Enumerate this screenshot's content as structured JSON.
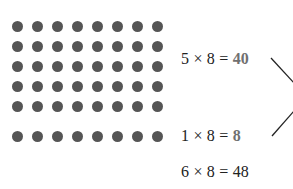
{
  "diagram": {
    "dot_color": "#555555",
    "grid": {
      "rows": 5,
      "cols": 8
    },
    "single_row": {
      "rows": 1,
      "cols": 8
    },
    "equations": [
      {
        "left": "5 × 8 = ",
        "result": "40",
        "highlight": true
      },
      {
        "left": "1 × 8 = ",
        "result": "8",
        "highlight": true
      },
      {
        "left": "6 × 8 = ",
        "result": "48",
        "highlight": false
      }
    ],
    "highlight_color": "#707070"
  }
}
